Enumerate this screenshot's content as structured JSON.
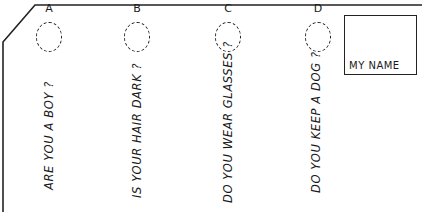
{
  "card": {
    "name_box": {
      "label": "MY NAME"
    },
    "questions": [
      {
        "letter": "A",
        "text": "ARE YOU A BOY ?"
      },
      {
        "letter": "B",
        "text": "IS YOUR HAIR DARK ?"
      },
      {
        "letter": "C",
        "text": "DO YOU WEAR GLASSES ?"
      },
      {
        "letter": "D",
        "text": "DO YOU KEEP A DOG ?"
      }
    ]
  }
}
